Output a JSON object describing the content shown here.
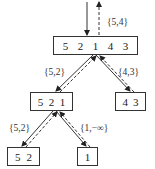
{
  "diagram": {
    "nodes": [
      {
        "id": "root",
        "values": [
          "5",
          "2",
          "1",
          "4",
          "3"
        ]
      },
      {
        "id": "mid-left",
        "values": [
          "5",
          "2",
          "1"
        ]
      },
      {
        "id": "mid-right",
        "values": [
          "4",
          "3"
        ]
      },
      {
        "id": "bottom-left",
        "values": [
          "5",
          "2"
        ]
      },
      {
        "id": "bottom-right",
        "values": [
          "1"
        ]
      }
    ],
    "edges": [
      {
        "from": "input",
        "to": "root",
        "label": "{5,4}"
      },
      {
        "from": "root",
        "to": "mid-left",
        "label": "{5,2}"
      },
      {
        "from": "root",
        "to": "mid-right",
        "label": "{4,3}"
      },
      {
        "from": "mid-left",
        "to": "bottom-left",
        "label": "{5,2}"
      },
      {
        "from": "mid-left",
        "to": "bottom-right",
        "label": "{1,−∞}"
      }
    ]
  }
}
